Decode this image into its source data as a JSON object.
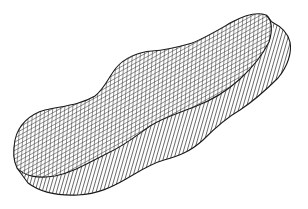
{
  "figure": {
    "colors": {
      "line": "#1a1a1a",
      "background": "#ffffff"
    },
    "top_surface": {
      "pattern": "grid",
      "cell_labels_legible": false
    },
    "side_faces": {
      "pattern": "vertical-hatching"
    }
  }
}
